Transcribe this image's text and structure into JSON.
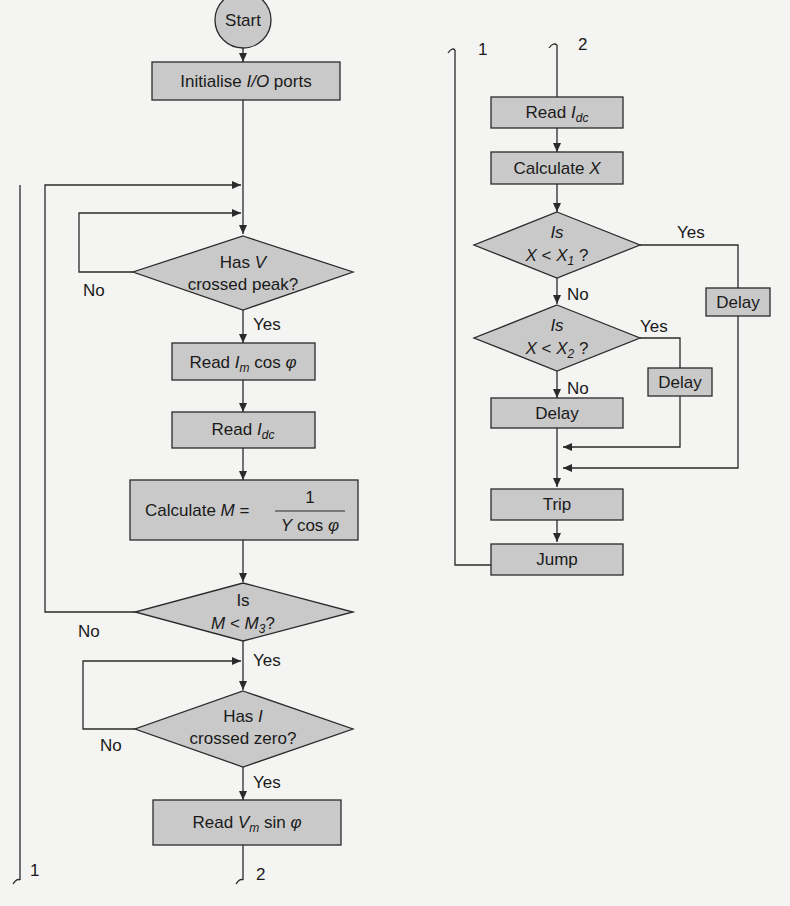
{
  "colors": {
    "background": "#f4f4f2",
    "node_fill": "#c9c9c9",
    "stroke": "#2a2a2a",
    "text": "#1a1a1a"
  },
  "left_flow": {
    "start": "Start",
    "init": {
      "pre": "Initialise ",
      "io": "I/O",
      "post": " ports"
    },
    "dec_v_peak": {
      "line1_pre": "Has ",
      "line1_var": "V",
      "line2": "crossed peak?",
      "yes": "Yes",
      "no": "No"
    },
    "read_im": {
      "pre": "Read ",
      "var": "I",
      "sub": "m",
      "post": " cos ",
      "phi": "φ"
    },
    "read_idc": {
      "pre": "Read ",
      "var": "I",
      "sub": "dc"
    },
    "calc_m": {
      "pre": "Calculate ",
      "var": "M",
      "eq": " = ",
      "num": "1",
      "den_var": "Y",
      "den_post": " cos ",
      "phi": "φ"
    },
    "dec_m": {
      "line1": "Is",
      "var": "M",
      "op": " < ",
      "var2": "M",
      "sub2": "3",
      "q": "?",
      "yes": "Yes",
      "no": "No"
    },
    "dec_i_zero": {
      "line1_pre": "Has ",
      "line1_var": "I",
      "line2": "crossed zero?",
      "yes": "Yes",
      "no": "No"
    },
    "read_vm": {
      "pre": "Read ",
      "var": "V",
      "sub": "m",
      "post": " sin ",
      "phi": "φ"
    },
    "connector_1": "1",
    "connector_2": "2"
  },
  "right_flow": {
    "connector_1": "1",
    "connector_2": "2",
    "read_idc": {
      "pre": "Read ",
      "var": "I",
      "sub": "dc"
    },
    "calc_x": {
      "pre": "Calculate ",
      "var": "X"
    },
    "dec_x1": {
      "line1": "Is",
      "var": "X",
      "op": " < ",
      "var2": "X",
      "sub2": "1",
      "q": " ?",
      "yes": "Yes",
      "no": "No"
    },
    "dec_x2": {
      "line1": "Is",
      "var": "X",
      "op": " < ",
      "var2": "X",
      "sub2": "2",
      "q": " ?",
      "yes": "Yes",
      "no": "No"
    },
    "delay_main": "Delay",
    "delay_x2": "Delay",
    "delay_x1": "Delay",
    "trip": "Trip",
    "jump": "Jump"
  }
}
